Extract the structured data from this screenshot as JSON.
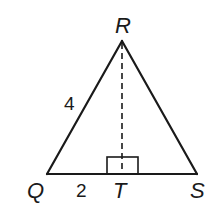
{
  "figure": {
    "type": "triangle",
    "vertices": {
      "R": {
        "label": "R"
      },
      "Q": {
        "label": "Q"
      },
      "S": {
        "label": "S"
      },
      "T": {
        "label": "T"
      }
    },
    "segments": [
      {
        "name": "QR",
        "length_label": "4"
      },
      {
        "name": "QT",
        "length_label": "2"
      },
      {
        "name": "RS",
        "length_label": ""
      },
      {
        "name": "TS",
        "length_label": ""
      },
      {
        "name": "RT",
        "style": "dashed",
        "note": "altitude"
      }
    ],
    "right_angle_at": "T",
    "labels": {
      "R": "R",
      "Q": "Q",
      "S": "S",
      "T": "T",
      "QR_length": "4",
      "QT_length": "2"
    },
    "colors": {
      "stroke": "#1a1a1a",
      "background": "#ffffff"
    }
  }
}
